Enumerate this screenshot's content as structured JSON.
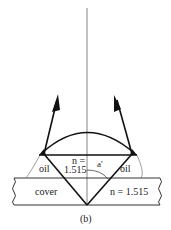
{
  "diagram": {
    "caption": "(b)",
    "labels": {
      "oil_left": "oil",
      "oil_right": "oil",
      "n_hemisphere_line1": "n =",
      "n_hemisphere_line2": "1.515",
      "angle": "a'",
      "cover": "cover",
      "n_cover": "n = 1.515"
    },
    "colors": {
      "line": "#111111",
      "thin_line": "#555555",
      "background": "#ffffff"
    }
  }
}
